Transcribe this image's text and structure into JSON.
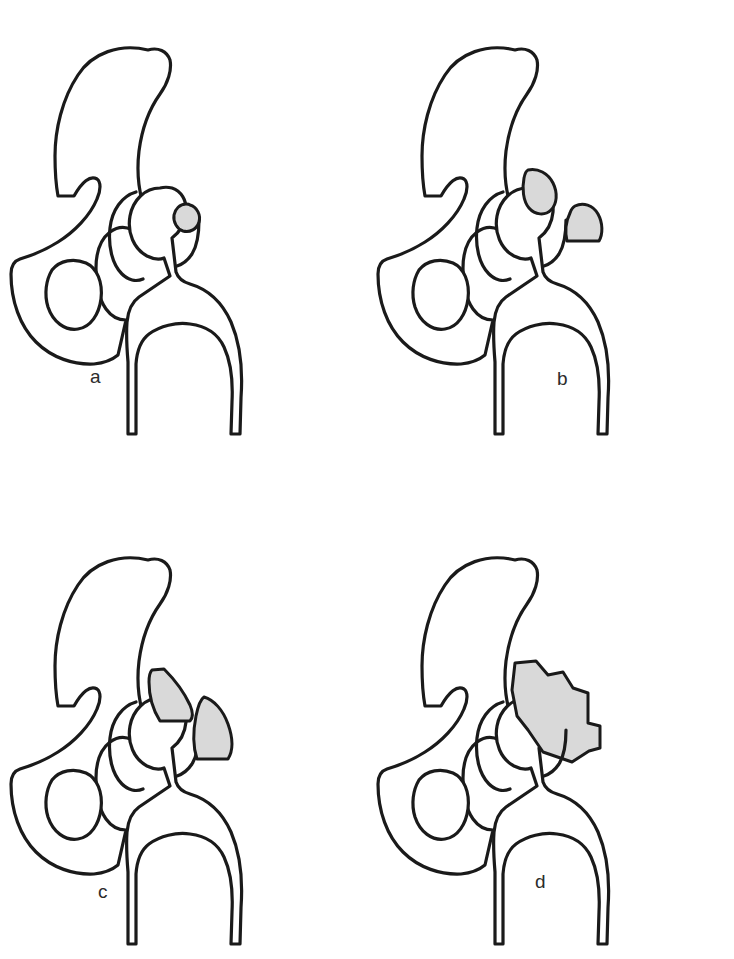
{
  "figure": {
    "background_color": "#ffffff",
    "outline_color": "#1a1a1a",
    "ossification_fill": "#d9d9d9",
    "label_color": "#2b2b2b",
    "panel_count": 4,
    "caption_partial": "cut-off caption line"
  },
  "panels": [
    {
      "id": "a",
      "label": "a",
      "grade": "I",
      "description": "Islands of bone within the soft tissues about the hip",
      "ossification_shapes": 1
    },
    {
      "id": "b",
      "label": "b",
      "grade": "II",
      "description": "Bone spurs from the pelvis or proximal femur leaving at least 1 cm between opposing bone surfaces",
      "ossification_shapes": 2
    },
    {
      "id": "c",
      "label": "c",
      "grade": "III",
      "description": "Bone spurs from the pelvis or proximal femur reducing the space between opposing bone surfaces to less than 1 cm",
      "ossification_shapes": 2
    },
    {
      "id": "d",
      "label": "d",
      "grade": "IV",
      "description": "Apparent bony ankylosis of the hip",
      "ossification_shapes": 1
    }
  ],
  "anatomy_parts": [
    "ilium",
    "iliac wing",
    "greater sciatic notch",
    "acetabulum",
    "obturator foramen",
    "ischium",
    "femoral head",
    "femoral neck",
    "greater trochanter",
    "lesser trochanter",
    "femoral shaft"
  ]
}
